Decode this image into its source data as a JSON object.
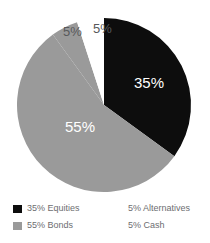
{
  "chart_data": {
    "type": "pie",
    "title": "",
    "subtitle": "",
    "xlabel": "",
    "ylabel": "",
    "grid": false,
    "legend_position": "bottom",
    "start_angle_deg": 0,
    "direction": "clockwise",
    "center": {
      "x": 104,
      "y": 105
    },
    "radius": 87,
    "categories": [
      "Equities",
      "Bonds",
      "Alternatives",
      "Cash"
    ],
    "values": [
      35,
      55,
      5,
      5
    ],
    "units": "percent",
    "total": 100,
    "slices": [
      {
        "name": "Equities",
        "value": 35,
        "value_label": "35%",
        "color": "#0d0d0d",
        "label_placement": "inside",
        "label_color": "#ffffff",
        "start_angle_deg": 0,
        "end_angle_deg": 126
      },
      {
        "name": "Bonds",
        "value": 55,
        "value_label": "55%",
        "color": "#9a9a9a",
        "label_placement": "inside",
        "label_color": "#ffffff",
        "start_angle_deg": 126,
        "end_angle_deg": 324
      },
      {
        "name": "Alternatives",
        "value": 5,
        "value_label": "5%",
        "color": "#9a9a9a",
        "label_placement": "outside",
        "label_color": "#58595b",
        "start_angle_deg": 324,
        "end_angle_deg": 342
      },
      {
        "name": "Cash",
        "value": 5,
        "value_label": "5%",
        "color": "#ffffff",
        "label_placement": "outside",
        "label_color": "#58595b",
        "start_angle_deg": 342,
        "end_angle_deg": 360
      }
    ],
    "legend": [
      {
        "label": "35% Equities",
        "swatch_color": "#0d0d0d",
        "swatch_visible": true,
        "column": "left"
      },
      {
        "label": "55% Bonds",
        "swatch_color": "#9a9a9a",
        "swatch_visible": true,
        "column": "left"
      },
      {
        "label": "5% Alternatives",
        "swatch_color": "#e9e9e9",
        "swatch_visible": false,
        "column": "right"
      },
      {
        "label": "5% Cash",
        "swatch_color": "#ffffff",
        "swatch_visible": false,
        "column": "right"
      }
    ]
  },
  "colors": {
    "equities_black": "#0d0d0d",
    "bonds_gray": "#9a9a9a",
    "cash_white": "#ffffff",
    "label_gray": "#58595b",
    "legend_text_gray": "#6d6e71",
    "background": "#ffffff"
  }
}
